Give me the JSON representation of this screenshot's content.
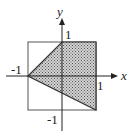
{
  "diagram": {
    "type": "region-plot",
    "axes": {
      "x_label": "x",
      "y_label": "y"
    },
    "ticks": {
      "x_pos": "1",
      "x_neg": "-1",
      "y_pos": "1",
      "y_neg": "-1"
    },
    "square": {
      "x_range": [
        -1,
        1
      ],
      "y_range": [
        -1,
        1
      ]
    },
    "shaded_region": {
      "vertices": [
        [
          -1,
          0
        ],
        [
          0,
          1
        ],
        [
          1,
          1
        ],
        [
          1,
          -1
        ]
      ],
      "fill_pattern": "stipple"
    },
    "colors": {
      "line": "#333333",
      "shade": "#9a9a9a",
      "background": "#ffffff"
    }
  }
}
